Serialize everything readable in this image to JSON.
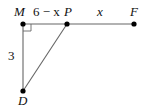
{
  "diagram": {
    "points": {
      "M": {
        "label": "M",
        "x": 23,
        "y": 24
      },
      "P": {
        "label": "P",
        "x": 67,
        "y": 24
      },
      "F": {
        "label": "F",
        "x": 134,
        "y": 24
      },
      "D": {
        "label": "D",
        "x": 23,
        "y": 91
      }
    },
    "segment_labels": {
      "MP": "6 − x",
      "PF": "x",
      "MD": "3"
    },
    "right_angle_at": "M",
    "colors": {
      "line": "#555555",
      "point": "#000000",
      "text": "#111111"
    }
  }
}
